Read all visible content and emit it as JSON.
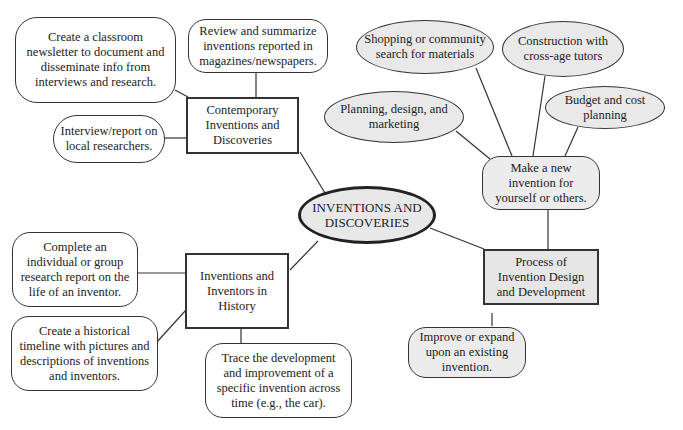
{
  "diagram": {
    "center": {
      "label": "INVENTIONS AND DISCOVERIES"
    },
    "branches": [
      {
        "label": "Contemporary Inventions and Discoveries",
        "children": [
          {
            "label": "Create a classroom newsletter to document and disseminate info from interviews and research."
          },
          {
            "label": "Review and summarize inventions reported in magazines/newspapers."
          },
          {
            "label": "Interview/report on local researchers."
          }
        ]
      },
      {
        "label": "Inventions and Inventors in History",
        "children": [
          {
            "label": "Complete an individual or group research report on the life of an inventor."
          },
          {
            "label": "Create a historical timeline with pictures and descriptions of inventions and inventors."
          },
          {
            "label": "Trace the development and improvement of a specific invention across time (e.g., the car)."
          }
        ]
      },
      {
        "label": "Process of Invention Design and Development",
        "children": [
          {
            "label": "Make a new invention for yourself or others.",
            "children": [
              {
                "label": "Planning, design, and marketing"
              },
              {
                "label": "Shopping or community search for materials"
              },
              {
                "label": "Construction with cross-age tutors"
              },
              {
                "label": "Budget and cost planning"
              }
            ]
          },
          {
            "label": "Improve or expand upon an existing invention."
          }
        ]
      }
    ]
  },
  "colors": {
    "stroke": "#333333",
    "gray_fill": "#e9e9e9",
    "background": "#ffffff"
  }
}
